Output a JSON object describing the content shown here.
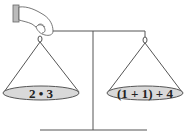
{
  "diagram": {
    "type": "balance-scale",
    "left_pan": {
      "label": "2 • 3"
    },
    "right_pan": {
      "label": "(1 + 1) + 4"
    },
    "colors": {
      "pan_fill": "#d9d9d9",
      "line": "#555555"
    }
  }
}
